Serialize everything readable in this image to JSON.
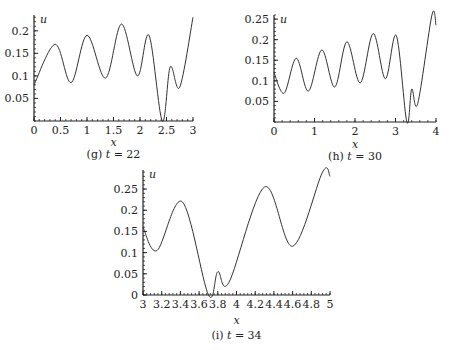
{
  "chart_data": [
    {
      "id": "g",
      "type": "line",
      "caption": "(g) t = 22",
      "caption_label": "(g)",
      "caption_var": "t",
      "caption_value": "= 22",
      "xlabel": "x",
      "ylabel": "u",
      "xlim": [
        0,
        3
      ],
      "ylim": [
        0,
        0.235
      ],
      "x_ticks": [
        0,
        0.5,
        1,
        1.5,
        2,
        2.5,
        3
      ],
      "x_tick_labels": [
        "0",
        "0.5",
        "1",
        "1.5",
        "2",
        "2.5",
        "3"
      ],
      "y_ticks": [
        0.05,
        0.1,
        0.15,
        0.2
      ],
      "y_tick_labels": [
        "0.05",
        "0.1",
        "0.15",
        "0.2"
      ],
      "grid": false,
      "series": [
        {
          "name": "u",
          "x": [
            0,
            0.4,
            0.7,
            1.0,
            1.35,
            1.65,
            1.95,
            2.17,
            2.42,
            2.57,
            2.75,
            3.0
          ],
          "values": [
            0.08,
            0.17,
            0.085,
            0.19,
            0.095,
            0.215,
            0.1,
            0.19,
            0.0,
            0.12,
            0.075,
            0.23
          ]
        }
      ]
    },
    {
      "id": "h",
      "type": "line",
      "caption": "(h) t = 30",
      "caption_label": "(h)",
      "caption_var": "t",
      "caption_value": "= 30",
      "xlabel": "x",
      "ylabel": "u",
      "xlim": [
        0,
        4
      ],
      "ylim": [
        0,
        0.26
      ],
      "x_ticks": [
        0,
        1,
        2,
        3,
        4
      ],
      "x_tick_labels": [
        "0",
        "1",
        "2",
        "3",
        "4"
      ],
      "y_ticks": [
        0.05,
        0.1,
        0.15,
        0.2,
        0.25
      ],
      "y_tick_labels": [
        "0.05",
        "0.1",
        "0.15",
        "0.2",
        "0.25"
      ],
      "grid": false,
      "series": [
        {
          "name": "u",
          "x": [
            0,
            0.25,
            0.55,
            0.85,
            1.18,
            1.5,
            1.8,
            2.13,
            2.45,
            2.75,
            3.02,
            3.28,
            3.4,
            3.55,
            3.9,
            4.0
          ],
          "values": [
            0.12,
            0.07,
            0.155,
            0.075,
            0.175,
            0.085,
            0.195,
            0.095,
            0.215,
            0.105,
            0.21,
            0.0,
            0.08,
            0.045,
            0.26,
            0.235
          ]
        }
      ]
    },
    {
      "id": "i",
      "type": "line",
      "caption": "(i) t = 34",
      "caption_label": "(i)",
      "caption_var": "t",
      "caption_value": "= 34",
      "xlabel": "x",
      "ylabel": "u",
      "xlim": [
        3,
        5
      ],
      "ylim": [
        0,
        0.295
      ],
      "x_ticks": [
        3,
        3.2,
        3.4,
        3.6,
        3.8,
        4,
        4.2,
        4.4,
        4.6,
        4.8,
        5
      ],
      "x_tick_labels": [
        "3",
        "3.2",
        "3.4",
        "3.6",
        "3.8",
        "4",
        "4.2",
        "4.4",
        "4.6",
        "4.8",
        "5"
      ],
      "y_ticks": [
        0,
        0.05,
        0.1,
        0.15,
        0.2,
        0.25
      ],
      "y_tick_labels": [
        "0",
        "0.05",
        "0.1",
        "0.15",
        "0.2",
        "0.25"
      ],
      "grid": false,
      "series": [
        {
          "name": "u",
          "x": [
            3.0,
            3.15,
            3.42,
            3.7,
            3.8,
            3.92,
            4.3,
            4.6,
            4.92,
            5.0
          ],
          "values": [
            0.16,
            0.105,
            0.22,
            0.0,
            0.055,
            0.03,
            0.255,
            0.115,
            0.29,
            0.28
          ]
        }
      ]
    }
  ]
}
